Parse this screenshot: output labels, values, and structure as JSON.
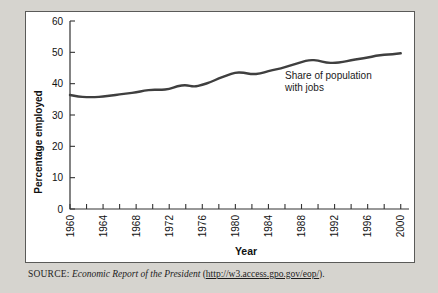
{
  "figure": {
    "background": "#ffffff",
    "page_background": "#d6d4cf",
    "border_color": "#5a5a58"
  },
  "source": {
    "kicker": "SOURCE:",
    "title": "Economic Report of the President",
    "open_paren": " (",
    "url": "http://w3.access.gpo.gov/eop/",
    "close_paren": ")."
  },
  "chart_data": {
    "type": "line",
    "title": "",
    "xlabel": "Year",
    "ylabel": "Percentage employed",
    "xlim": [
      1960,
      2001
    ],
    "ylim": [
      0,
      60
    ],
    "grid": false,
    "legend_position": "none",
    "line_color": "#3f3f3f",
    "line_width": 2.4,
    "yticks": [
      0,
      10,
      20,
      30,
      40,
      50,
      60
    ],
    "ytick_labels": [
      "0",
      "10",
      "20",
      "30",
      "40",
      "50",
      "60"
    ],
    "xticks": [
      1960,
      1962,
      1964,
      1966,
      1968,
      1970,
      1972,
      1974,
      1976,
      1978,
      1980,
      1982,
      1984,
      1986,
      1988,
      1990,
      1992,
      1994,
      1996,
      1998,
      2000
    ],
    "xtick_labels": [
      "1960",
      "",
      "1964",
      "",
      "1968",
      "",
      "1972",
      "",
      "1976",
      "",
      "1980",
      "",
      "1984",
      "",
      "1988",
      "",
      "1992",
      "",
      "1996",
      "",
      "2000"
    ],
    "annotations": [
      {
        "name": "series-annotation",
        "line1": "Share of population",
        "line2": "with jobs",
        "x": 1986,
        "y": 41.5
      }
    ],
    "series": [
      {
        "name": "Share of population with jobs",
        "x": [
          1960,
          1961,
          1962,
          1963,
          1964,
          1965,
          1966,
          1967,
          1968,
          1969,
          1970,
          1971,
          1972,
          1973,
          1974,
          1975,
          1976,
          1977,
          1978,
          1979,
          1980,
          1981,
          1982,
          1983,
          1984,
          1985,
          1986,
          1987,
          1988,
          1989,
          1990,
          1991,
          1992,
          1993,
          1994,
          1995,
          1996,
          1997,
          1998,
          1999,
          2000
        ],
        "values": [
          36.4,
          35.9,
          35.7,
          35.7,
          35.9,
          36.2,
          36.6,
          36.9,
          37.2,
          37.8,
          38.1,
          38.0,
          38.3,
          39.2,
          39.6,
          39.0,
          39.6,
          40.5,
          41.7,
          42.6,
          43.6,
          43.5,
          43.0,
          43.2,
          44.0,
          44.6,
          45.2,
          46.1,
          46.9,
          47.6,
          47.4,
          46.7,
          46.6,
          46.9,
          47.5,
          47.9,
          48.3,
          48.9,
          49.2,
          49.4,
          49.7
        ]
      }
    ]
  }
}
